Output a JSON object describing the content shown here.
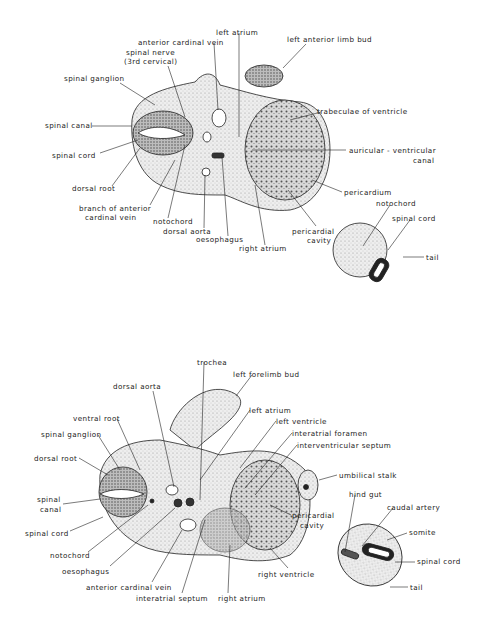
{
  "figures": [
    {
      "id": "upper",
      "description": "Transverse section of embryo at level of heart (ventricle/atrium) with tail section",
      "labels": [
        {
          "text": "left atrium",
          "x": 216,
          "y": 29
        },
        {
          "text": "anterior cardinal vein",
          "x": 138,
          "y": 39
        },
        {
          "text": "left anterior limb bud",
          "x": 287,
          "y": 36
        },
        {
          "text": "spinal nerve",
          "x": 126,
          "y": 49
        },
        {
          "text": "(3rd cervical)",
          "x": 124,
          "y": 58
        },
        {
          "text": "spinal ganglion",
          "x": 64,
          "y": 75
        },
        {
          "text": "trabeculae of ventricle",
          "x": 317,
          "y": 108
        },
        {
          "text": "spinal canal",
          "x": 45,
          "y": 122
        },
        {
          "text": "spinal cord",
          "x": 52,
          "y": 152
        },
        {
          "text": "auricular - ventricular",
          "x": 349,
          "y": 147
        },
        {
          "text": "canal",
          "x": 413,
          "y": 157
        },
        {
          "text": "dorsal root",
          "x": 72,
          "y": 185
        },
        {
          "text": "branch of anterior",
          "x": 79,
          "y": 205
        },
        {
          "text": "cardinal vein",
          "x": 85,
          "y": 214
        },
        {
          "text": "notochord",
          "x": 153,
          "y": 218
        },
        {
          "text": "dorsal aorta",
          "x": 163,
          "y": 228
        },
        {
          "text": "oesophagus",
          "x": 196,
          "y": 236
        },
        {
          "text": "right atrium",
          "x": 239,
          "y": 245
        },
        {
          "text": "pericardium",
          "x": 344,
          "y": 189
        },
        {
          "text": "notochord",
          "x": 376,
          "y": 200
        },
        {
          "text": "pericardial",
          "x": 292,
          "y": 228
        },
        {
          "text": "cavity",
          "x": 307,
          "y": 237
        },
        {
          "text": "spinal cord",
          "x": 392,
          "y": 215
        },
        {
          "text": "tail",
          "x": 426,
          "y": 254
        }
      ]
    },
    {
      "id": "lower",
      "description": "Transverse section of embryo at level of forelimb bud and heart with tail section",
      "labels": [
        {
          "text": "trochea",
          "x": 197,
          "y": 359
        },
        {
          "text": "left forelimb bud",
          "x": 233,
          "y": 371
        },
        {
          "text": "dorsal aorta",
          "x": 113,
          "y": 383
        },
        {
          "text": "left atrium",
          "x": 249,
          "y": 407
        },
        {
          "text": "ventral root",
          "x": 73,
          "y": 415
        },
        {
          "text": "left ventricle",
          "x": 276,
          "y": 418
        },
        {
          "text": "interatrial foramen",
          "x": 292,
          "y": 430
        },
        {
          "text": "spinal ganglion",
          "x": 41,
          "y": 431
        },
        {
          "text": "interventricular septum",
          "x": 297,
          "y": 442
        },
        {
          "text": "dorsal root",
          "x": 34,
          "y": 455
        },
        {
          "text": "umbilical stalk",
          "x": 339,
          "y": 472
        },
        {
          "text": "spinal",
          "x": 37,
          "y": 496
        },
        {
          "text": "canal",
          "x": 40,
          "y": 506
        },
        {
          "text": "hind gut",
          "x": 349,
          "y": 491
        },
        {
          "text": "pericardial",
          "x": 292,
          "y": 512
        },
        {
          "text": "cavity",
          "x": 300,
          "y": 522
        },
        {
          "text": "caudal artery",
          "x": 387,
          "y": 504
        },
        {
          "text": "spinal cord",
          "x": 25,
          "y": 530
        },
        {
          "text": "somite",
          "x": 409,
          "y": 529
        },
        {
          "text": "notochord",
          "x": 50,
          "y": 552
        },
        {
          "text": "spinal cord",
          "x": 417,
          "y": 558
        },
        {
          "text": "right ventricle",
          "x": 258,
          "y": 571
        },
        {
          "text": "oesophagus",
          "x": 62,
          "y": 568
        },
        {
          "text": "anterior cardinal vein",
          "x": 86,
          "y": 584
        },
        {
          "text": "tail",
          "x": 410,
          "y": 584
        },
        {
          "text": "interatrial septum",
          "x": 136,
          "y": 595
        },
        {
          "text": "right atrium",
          "x": 218,
          "y": 595
        }
      ]
    }
  ]
}
